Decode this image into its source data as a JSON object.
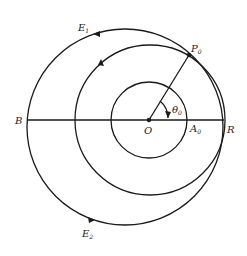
{
  "diagram": {
    "labels": {
      "E1": {
        "main": "E",
        "sub": "1"
      },
      "E2": {
        "main": "E",
        "sub": "2"
      },
      "P0": {
        "main": "P",
        "sub": "0"
      },
      "theta0": {
        "main": "θ",
        "sub": "0"
      },
      "B": "B",
      "O": "O",
      "A0": {
        "main": "A",
        "sub": "0"
      },
      "R": "R"
    },
    "colors": {
      "stroke": "#1a1a1a",
      "background": "#ffffff"
    }
  }
}
